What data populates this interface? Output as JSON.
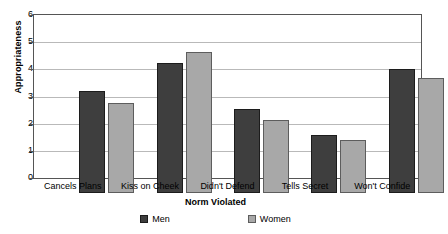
{
  "chart_data": {
    "type": "bar",
    "title": "",
    "xlabel": "Norm Violated",
    "ylabel": "Appropriateness",
    "categories": [
      "Cancels Plans",
      "Kiss on Cheek",
      "Didn't Defend",
      "Tells Secret",
      "Won't Confide"
    ],
    "series": [
      {
        "name": "Men",
        "color": "#3e3e3e",
        "values": [
          3.75,
          4.8,
          3.1,
          2.15,
          4.55
        ]
      },
      {
        "name": "Women",
        "color": "#a8a8a8",
        "values": [
          3.3,
          5.2,
          2.7,
          1.95,
          4.25
        ]
      }
    ],
    "ylim": [
      0,
      6
    ],
    "yticks": [
      0,
      1,
      2,
      3,
      4,
      5,
      6
    ],
    "ytick_labels": [
      "0",
      "1",
      "2",
      "3",
      "4",
      "5",
      "6"
    ],
    "grid": true,
    "legend_position": "bottom"
  }
}
